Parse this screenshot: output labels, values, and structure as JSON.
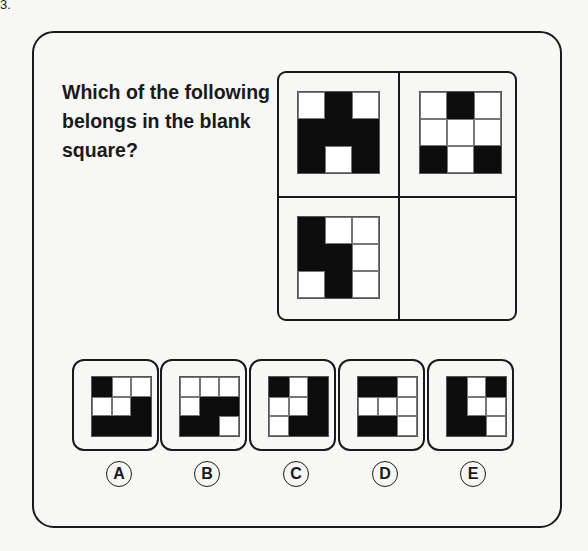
{
  "corner_label": "3.",
  "question": "Which of the following belongs in the blank square?",
  "puzzle": {
    "grids": [
      {
        "position": "top-left",
        "cells": [
          [
            0,
            1,
            0
          ],
          [
            1,
            1,
            1
          ],
          [
            1,
            0,
            1
          ]
        ]
      },
      {
        "position": "top-right",
        "cells": [
          [
            0,
            1,
            0
          ],
          [
            0,
            0,
            0
          ],
          [
            1,
            0,
            1
          ]
        ]
      },
      {
        "position": "bottom-left",
        "cells": [
          [
            1,
            0,
            0
          ],
          [
            1,
            1,
            0
          ],
          [
            0,
            1,
            0
          ]
        ]
      },
      {
        "position": "bottom-right",
        "cells": null
      }
    ]
  },
  "options": [
    {
      "label": "A",
      "cells": [
        [
          1,
          0,
          0
        ],
        [
          0,
          0,
          1
        ],
        [
          1,
          1,
          1
        ]
      ]
    },
    {
      "label": "B",
      "cells": [
        [
          0,
          0,
          0
        ],
        [
          0,
          1,
          1
        ],
        [
          1,
          1,
          0
        ]
      ]
    },
    {
      "label": "C",
      "cells": [
        [
          1,
          0,
          1
        ],
        [
          0,
          0,
          1
        ],
        [
          0,
          1,
          1
        ]
      ]
    },
    {
      "label": "D",
      "cells": [
        [
          1,
          1,
          0
        ],
        [
          0,
          0,
          0
        ],
        [
          1,
          1,
          0
        ]
      ]
    },
    {
      "label": "E",
      "cells": [
        [
          1,
          0,
          1
        ],
        [
          1,
          0,
          0
        ],
        [
          1,
          1,
          0
        ]
      ]
    }
  ],
  "colors": {
    "filled": "#0d0d0d",
    "empty": "#ffffff",
    "border": "#1a1a1a",
    "background": "#f7f7f5"
  }
}
